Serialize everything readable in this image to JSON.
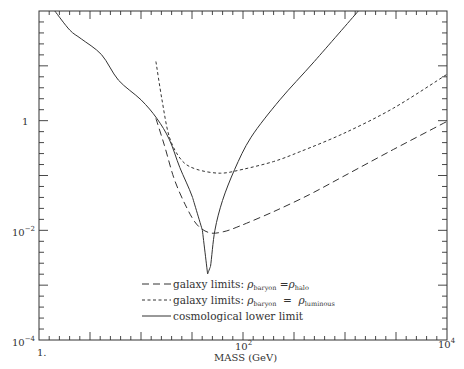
{
  "chart_data": {
    "type": "line",
    "title": "",
    "xlabel": "MASS (GeV)",
    "ylabel": "",
    "xscale": "log",
    "yscale": "log",
    "xlim": [
      1,
      10000
    ],
    "ylim": [
      0.0001,
      100
    ],
    "grid": false,
    "legend_position": "lower center (inside)",
    "x_tick_labels": [
      "1.",
      "10^2",
      "10^4"
    ],
    "y_tick_labels": [
      "10^-4",
      "10^-2",
      "1"
    ],
    "series": [
      {
        "name": "galaxy limits: ρ_baryon = ρ_halo",
        "style": "long-dash",
        "points": [
          [
            14,
            1.1
          ],
          [
            17,
            0.35
          ],
          [
            21,
            0.09
          ],
          [
            27,
            0.03
          ],
          [
            35,
            0.013
          ],
          [
            47,
            0.009
          ],
          [
            65,
            0.0095
          ],
          [
            93,
            0.012
          ],
          [
            200,
            0.022
          ],
          [
            450,
            0.045
          ],
          [
            1000,
            0.1
          ],
          [
            3000,
            0.3
          ],
          [
            10000,
            0.97
          ]
        ]
      },
      {
        "name": "galaxy limits: ρ_baryon = ρ_luminous",
        "style": "short-dash",
        "points": [
          [
            14,
            12
          ],
          [
            16,
            2.5
          ],
          [
            19,
            0.5
          ],
          [
            25,
            0.19
          ],
          [
            35,
            0.13
          ],
          [
            60,
            0.11
          ],
          [
            100,
            0.13
          ],
          [
            200,
            0.18
          ],
          [
            360,
            0.27
          ],
          [
            1000,
            0.6
          ],
          [
            3000,
            1.7
          ],
          [
            10000,
            7
          ]
        ]
      },
      {
        "name": "cosmological lower limit",
        "style": "solid",
        "points": [
          [
            1.43,
            100
          ],
          [
            2.0,
            45
          ],
          [
            2.6,
            31
          ],
          [
            4.1,
            16
          ],
          [
            6,
            5.5
          ],
          [
            10,
            2.4
          ],
          [
            14.3,
            1.1
          ],
          [
            19,
            0.45
          ],
          [
            24,
            0.14
          ],
          [
            32,
            0.04
          ],
          [
            40,
            0.01
          ],
          [
            45,
            0.0016
          ],
          [
            48,
            0.0022
          ],
          [
            53,
            0.01
          ],
          [
            63,
            0.035
          ],
          [
            83,
            0.13
          ],
          [
            120,
            0.5
          ],
          [
            230,
            2.4
          ],
          [
            500,
            12
          ],
          [
            1350,
            100
          ]
        ]
      }
    ]
  },
  "axes": {
    "x_title": "MASS (GeV)",
    "x_labels": [
      {
        "base": "1.",
        "exp": ""
      },
      {
        "base": "10",
        "exp": "2"
      },
      {
        "base": "10",
        "exp": "4"
      }
    ],
    "y_labels": [
      {
        "base": "1",
        "exp": ""
      },
      {
        "base": "10",
        "exp": "−2"
      },
      {
        "base": "10",
        "exp": "−4"
      }
    ]
  },
  "legend": [
    {
      "prefix": "galaxy limits: ",
      "rho1": "ρ",
      "sub1": "baryon",
      "op": " =",
      "rho2": "ρ",
      "sub2": "halo",
      "style": "long-dash"
    },
    {
      "prefix": "galaxy limits: ",
      "rho1": "ρ",
      "sub1": "baryon",
      "op": "  =  ",
      "rho2": "ρ",
      "sub2": "luminous",
      "style": "short-dash"
    },
    {
      "prefix": "cosmological lower limit",
      "style": "solid"
    }
  ],
  "colors": {
    "ink": "#333333",
    "background": "#ffffff"
  }
}
